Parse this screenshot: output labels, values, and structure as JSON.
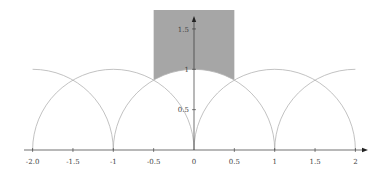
{
  "diagram": {
    "region_fill": "#a6a6a6",
    "arc_color": "#b0b0b0",
    "axis_color": "#333333",
    "x_axis": {
      "ticks": [
        {
          "value": -2,
          "label": "-2.0"
        },
        {
          "value": -1.5,
          "label": "-1.5"
        },
        {
          "value": -1,
          "label": "-1"
        },
        {
          "value": -0.5,
          "label": "-0.5"
        },
        {
          "value": 0,
          "label": "0"
        },
        {
          "value": 0.5,
          "label": "0.5"
        },
        {
          "value": 1,
          "label": "1"
        },
        {
          "value": 1.5,
          "label": "1.5"
        },
        {
          "value": 2,
          "label": "2"
        }
      ]
    },
    "y_axis": {
      "ticks": [
        {
          "value": 0.5,
          "label": "0.5"
        },
        {
          "value": 1,
          "label": "1"
        },
        {
          "value": 1.5,
          "label": "1.5"
        }
      ]
    },
    "arcs": [
      {
        "center": -2,
        "radius": 1,
        "from": -2,
        "to": -1
      },
      {
        "center": -1,
        "radius": 1,
        "from": -2,
        "to": 0
      },
      {
        "center": 0,
        "radius": 1,
        "from": -1,
        "to": 1
      },
      {
        "center": 1,
        "radius": 1,
        "from": 0,
        "to": 2
      },
      {
        "center": 2,
        "radius": 1,
        "from": 1,
        "to": 2
      }
    ],
    "shaded_region": {
      "x_min": -0.5,
      "x_max": 0.5,
      "y_top": 1.73,
      "bottom": "arc |z|=1"
    }
  }
}
